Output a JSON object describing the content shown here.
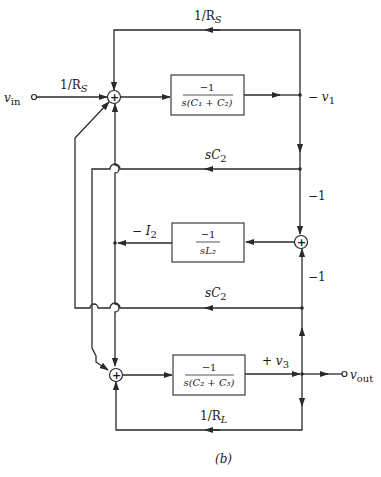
{
  "diagram": {
    "type": "signal-flow block diagram",
    "caption": "(b)",
    "input": {
      "label": "v",
      "sub": "in"
    },
    "output": {
      "label": "v",
      "sub": "out"
    },
    "gains": {
      "input_gain": "1/R",
      "input_gain_sub": "S",
      "top_feedback": "1/R",
      "top_feedback_sub": "S",
      "sc2_upper": "sC",
      "sc2_upper_sub": "2",
      "sc2_lower": "sC",
      "sc2_lower_sub": "2",
      "neg_one_upper": "−1",
      "neg_one_lower": "−1",
      "load_feedback": "1/R",
      "load_feedback_sub": "L"
    },
    "blocks": [
      {
        "id": "block-1",
        "numerator": "−1",
        "denominator": "s(C₁ + C₂)"
      },
      {
        "id": "block-2",
        "numerator": "−1",
        "denominator": "sL₂"
      },
      {
        "id": "block-3",
        "numerator": "−1",
        "denominator": "s(C₂ + C₃)"
      }
    ],
    "nodes": {
      "v1": {
        "label": "− v",
        "sub": "1"
      },
      "i2": {
        "label": "− I",
        "sub": "2"
      },
      "v3": {
        "label": "+ v",
        "sub": "3"
      }
    },
    "summing_junction_symbol": "+"
  }
}
